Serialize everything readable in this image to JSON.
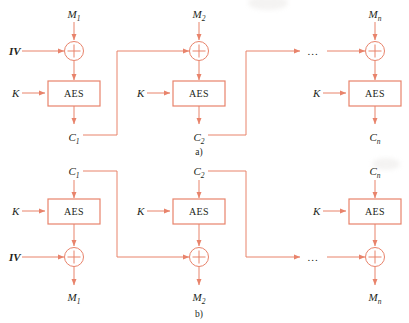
{
  "figure": {
    "type": "block-cipher-mode-diagram",
    "cipher_label": "AES",
    "key_label": "K",
    "iv_label": "IV",
    "ellipsis": "...",
    "colors": {
      "wire": "#e8836b",
      "box_stroke": "#e8836b",
      "box_fill": "#ffffff",
      "text": "#231f20",
      "background": "#ffffff"
    },
    "parts": [
      {
        "id": "a",
        "caption": "a)",
        "role": "encryption",
        "stages": [
          {
            "index": 1,
            "input_label": "M",
            "input_sub": "1",
            "side_input_label": "IV",
            "key_label": "K",
            "cipher_label": "AES",
            "output_label": "C",
            "output_sub": "1",
            "has_side_input": true,
            "has_ellipsis": false
          },
          {
            "index": 2,
            "input_label": "M",
            "input_sub": "2",
            "side_input_label": "",
            "key_label": "K",
            "cipher_label": "AES",
            "output_label": "C",
            "output_sub": "2",
            "has_side_input": false,
            "has_ellipsis": false
          },
          {
            "index": 3,
            "input_label": "M",
            "input_sub": "n",
            "side_input_label": "",
            "key_label": "K",
            "cipher_label": "AES",
            "output_label": "C",
            "output_sub": "n",
            "has_side_input": false,
            "has_ellipsis": true
          }
        ]
      },
      {
        "id": "b",
        "caption": "b)",
        "role": "decryption",
        "stages": [
          {
            "index": 1,
            "input_label": "C",
            "input_sub": "1",
            "side_input_label": "IV",
            "key_label": "K",
            "cipher_label": "AES",
            "output_label": "M",
            "output_sub": "1",
            "has_side_input": true,
            "has_ellipsis": false
          },
          {
            "index": 2,
            "input_label": "C",
            "input_sub": "2",
            "side_input_label": "",
            "key_label": "K",
            "cipher_label": "AES",
            "output_label": "M",
            "output_sub": "2",
            "has_side_input": false,
            "has_ellipsis": false
          },
          {
            "index": 3,
            "input_label": "C",
            "input_sub": "n",
            "side_input_label": "",
            "key_label": "K",
            "cipher_label": "AES",
            "output_label": "M",
            "output_sub": "n",
            "has_side_input": false,
            "has_ellipsis": true
          }
        ]
      }
    ]
  }
}
